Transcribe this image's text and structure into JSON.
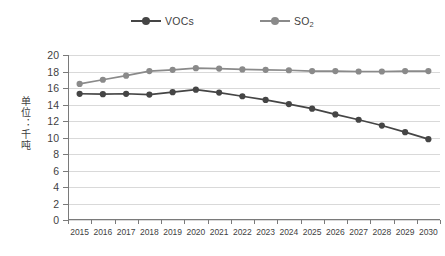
{
  "chart_data": {
    "type": "line",
    "title": "",
    "xlabel": "",
    "ylabel": "单位：千吨",
    "ylim": [
      0,
      20
    ],
    "ytick_step": 2,
    "yticks": [
      20,
      18,
      16,
      14,
      12,
      10,
      8,
      6,
      4,
      2,
      0
    ],
    "grid": true,
    "legend_position": "top-center",
    "categories": [
      "2015",
      "2016",
      "2017",
      "2018",
      "2019",
      "2020",
      "2021",
      "2022",
      "2023",
      "2024",
      "2025",
      "2026",
      "2027",
      "2028",
      "2029",
      "2030"
    ],
    "series": [
      {
        "name": "VOCs",
        "color": "#454545",
        "marker": "circle",
        "values": [
          15.3,
          15.25,
          15.3,
          15.2,
          15.5,
          15.8,
          15.45,
          15.0,
          14.55,
          14.05,
          13.5,
          12.8,
          12.15,
          11.45,
          10.65,
          9.8
        ]
      },
      {
        "name": "SO₂",
        "color": "#8a8a8a",
        "marker": "circle",
        "values": [
          16.5,
          17.0,
          17.5,
          18.05,
          18.2,
          18.4,
          18.35,
          18.25,
          18.2,
          18.15,
          18.05,
          18.05,
          18.0,
          18.0,
          18.05,
          18.05
        ]
      }
    ]
  },
  "legend": {
    "entries": [
      {
        "label_main": "VOCs",
        "label_sub": ""
      },
      {
        "label_main": "SO",
        "label_sub": "2"
      }
    ]
  },
  "colors": {
    "vocs": "#454545",
    "so2": "#8a8a8a",
    "gridline": "#d9d9d9",
    "axis": "#7a7a7a",
    "text": "#3f3f3f",
    "background": "#ffffff"
  }
}
